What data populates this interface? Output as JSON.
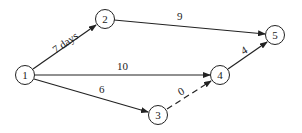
{
  "diagram": {
    "type": "activity-network",
    "nodes": [
      {
        "id": "1",
        "label": "1",
        "x": 25,
        "y": 75
      },
      {
        "id": "2",
        "label": "2",
        "x": 105,
        "y": 19
      },
      {
        "id": "3",
        "label": "3",
        "x": 158,
        "y": 115
      },
      {
        "id": "4",
        "label": "4",
        "x": 220,
        "y": 75
      },
      {
        "id": "5",
        "label": "5",
        "x": 275,
        "y": 35
      }
    ],
    "edges": [
      {
        "from": "1",
        "to": "2",
        "label": "7 days",
        "dashed": false
      },
      {
        "from": "2",
        "to": "5",
        "label": "9",
        "dashed": false
      },
      {
        "from": "1",
        "to": "4",
        "label": "10",
        "dashed": false
      },
      {
        "from": "1",
        "to": "3",
        "label": "6",
        "dashed": false
      },
      {
        "from": "3",
        "to": "4",
        "label": "0",
        "dashed": true
      },
      {
        "from": "4",
        "to": "5",
        "label": "4",
        "dashed": false
      }
    ]
  }
}
